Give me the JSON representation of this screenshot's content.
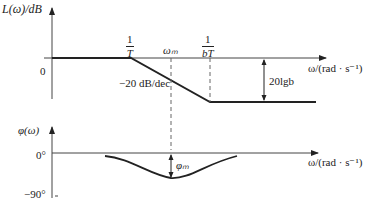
{
  "magnitude_plot": {
    "y_axis_label": "L(ω)/dB",
    "x_axis_label": "ω/(rad · s⁻¹)",
    "zero_label": "0",
    "corner1": {
      "num": "1",
      "den": "T"
    },
    "corner2": {
      "num": "1",
      "den": "bT"
    },
    "omega_m_label": "ωₘ",
    "slope_label": "−20 dB/dec",
    "gain_label": "20lgb"
  },
  "phase_plot": {
    "y_axis_label": "φ(ω)",
    "x_axis_label": "ω/(rad · s⁻¹)",
    "zero_label": "0°",
    "minus90_label": "−90°",
    "phi_m_label": "φₘ"
  },
  "colors": {
    "line": "#222222",
    "axis": "#444444",
    "dash": "#666666"
  }
}
